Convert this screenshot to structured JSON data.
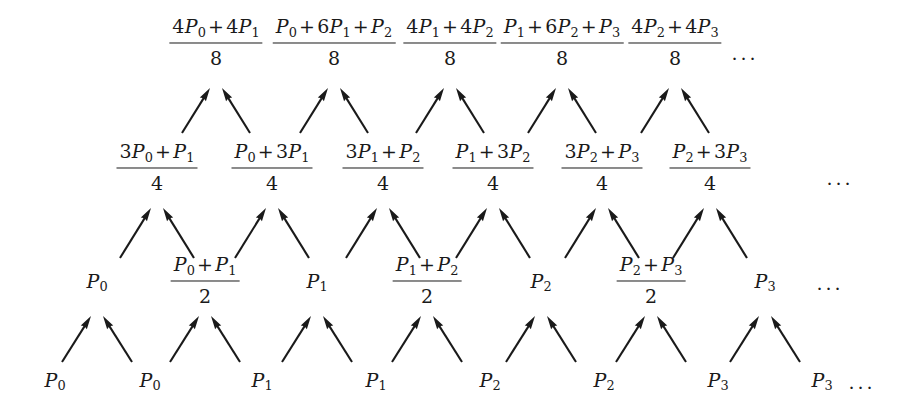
{
  "figure": {
    "type": "subdivision-scheme-pyramid",
    "ellipsis": "...",
    "arrow_color": "#1a1a1a",
    "text_color": "#1a1a1a",
    "background": "#ffffff"
  },
  "levels": [
    {
      "name": "level-3-top",
      "y": 45,
      "denominator": "8",
      "ellipsis_x": 745,
      "nodes": [
        {
          "x": 216,
          "numerator_parts": [
            "4",
            "P",
            "0",
            "+",
            "4",
            "P",
            "1"
          ],
          "numerator_text": "4P0 + 4P1",
          "denominator": "8",
          "kind": "fraction"
        },
        {
          "x": 334,
          "numerator_parts": [
            "P",
            "0",
            "+",
            "6",
            "P",
            "1",
            "+",
            "P",
            "2"
          ],
          "numerator_text": "P0 + 6P1 + P2",
          "denominator": "8",
          "kind": "fraction"
        },
        {
          "x": 450,
          "numerator_parts": [
            "4",
            "P",
            "1",
            "+",
            "4",
            "P",
            "2"
          ],
          "numerator_text": "4P1 + 4P2",
          "denominator": "8",
          "kind": "fraction"
        },
        {
          "x": 562,
          "numerator_parts": [
            "P",
            "1",
            "+",
            "6",
            "P",
            "2",
            "+",
            "P",
            "3"
          ],
          "numerator_text": "P1 + 6P2 + P3",
          "denominator": "8",
          "kind": "fraction"
        },
        {
          "x": 675,
          "numerator_parts": [
            "4",
            "P",
            "2",
            "+",
            "4",
            "P",
            "3"
          ],
          "numerator_text": "4P2 + 4P3",
          "denominator": "8",
          "kind": "fraction"
        }
      ]
    },
    {
      "name": "level-2",
      "y": 170,
      "denominator": "4",
      "ellipsis_x": 840,
      "nodes": [
        {
          "x": 157,
          "numerator_text": "3P0 + P1",
          "denominator": "4",
          "kind": "fraction"
        },
        {
          "x": 272,
          "numerator_text": "P0 + 3P1",
          "denominator": "4",
          "kind": "fraction"
        },
        {
          "x": 383,
          "numerator_text": "3P1 + P2",
          "denominator": "4",
          "kind": "fraction"
        },
        {
          "x": 493,
          "numerator_text": "P1 + 3P2",
          "denominator": "4",
          "kind": "fraction"
        },
        {
          "x": 602,
          "numerator_text": "3P2 + P3",
          "denominator": "4",
          "kind": "fraction"
        },
        {
          "x": 710,
          "numerator_text": "P2 + 3P3",
          "denominator": "4",
          "kind": "fraction"
        }
      ]
    },
    {
      "name": "level-1",
      "y": 283,
      "denominator": "2",
      "ellipsis_x": 830,
      "nodes": [
        {
          "x": 97,
          "text": "P0",
          "kind": "point"
        },
        {
          "x": 205,
          "numerator_text": "P0 + P1",
          "denominator": "2",
          "kind": "fraction"
        },
        {
          "x": 317,
          "text": "P1",
          "kind": "point"
        },
        {
          "x": 427,
          "numerator_text": "P1 + P2",
          "denominator": "2",
          "kind": "fraction"
        },
        {
          "x": 541,
          "text": "P2",
          "kind": "point"
        },
        {
          "x": 651,
          "numerator_text": "P2 + P3",
          "denominator": "2",
          "kind": "fraction"
        },
        {
          "x": 765,
          "text": "P3",
          "kind": "point"
        }
      ]
    },
    {
      "name": "level-0-base",
      "y": 382,
      "ellipsis_x": 862,
      "nodes": [
        {
          "x": 55,
          "text": "P0",
          "kind": "point"
        },
        {
          "x": 150,
          "text": "P0",
          "kind": "point"
        },
        {
          "x": 262,
          "text": "P1",
          "kind": "point"
        },
        {
          "x": 376,
          "text": "P1",
          "kind": "point"
        },
        {
          "x": 490,
          "text": "P2",
          "kind": "point"
        },
        {
          "x": 604,
          "text": "P2",
          "kind": "point"
        },
        {
          "x": 718,
          "text": "P3",
          "kind": "point"
        },
        {
          "x": 822,
          "text": "P3",
          "kind": "point"
        }
      ]
    }
  ],
  "arrow_bands": [
    {
      "name": "band-top",
      "y_tail": 133,
      "y_head": 88,
      "pairs": [
        {
          "target_x": 216,
          "left_tail_x": 182,
          "right_tail_x": 250
        },
        {
          "target_x": 334,
          "left_tail_x": 300,
          "right_tail_x": 368
        },
        {
          "target_x": 450,
          "left_tail_x": 416,
          "right_tail_x": 484
        },
        {
          "target_x": 562,
          "left_tail_x": 528,
          "right_tail_x": 596
        },
        {
          "target_x": 675,
          "left_tail_x": 641,
          "right_tail_x": 709
        }
      ]
    },
    {
      "name": "band-middle",
      "y_tail": 258,
      "y_head": 208,
      "pairs": [
        {
          "target_x": 157,
          "left_tail_x": 120,
          "right_tail_x": 194
        },
        {
          "target_x": 272,
          "left_tail_x": 235,
          "right_tail_x": 309
        },
        {
          "target_x": 383,
          "left_tail_x": 346,
          "right_tail_x": 420
        },
        {
          "target_x": 493,
          "left_tail_x": 456,
          "right_tail_x": 530
        },
        {
          "target_x": 602,
          "left_tail_x": 565,
          "right_tail_x": 639
        },
        {
          "target_x": 710,
          "left_tail_x": 673,
          "right_tail_x": 747
        }
      ]
    },
    {
      "name": "band-bottom",
      "y_tail": 362,
      "y_head": 316,
      "pairs": [
        {
          "target_x": 97,
          "left_tail_x": 62,
          "right_tail_x": 132
        },
        {
          "target_x": 205,
          "left_tail_x": 170,
          "right_tail_x": 240
        },
        {
          "target_x": 317,
          "left_tail_x": 282,
          "right_tail_x": 352
        },
        {
          "target_x": 427,
          "left_tail_x": 392,
          "right_tail_x": 462
        },
        {
          "target_x": 541,
          "left_tail_x": 506,
          "right_tail_x": 576
        },
        {
          "target_x": 651,
          "left_tail_x": 616,
          "right_tail_x": 686
        },
        {
          "target_x": 765,
          "left_tail_x": 730,
          "right_tail_x": 800
        }
      ]
    }
  ]
}
